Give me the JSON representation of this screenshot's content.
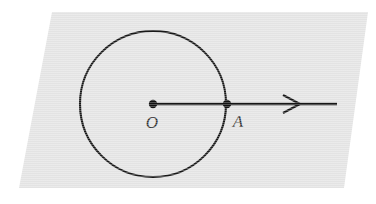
{
  "figure": {
    "background_color": "#ffffff",
    "plane": {
      "name": "plane",
      "fill_color": "#e3e3e3",
      "shape": "parallelogram",
      "points": "52,12 368,12 344,188 19,188"
    },
    "circle": {
      "label": "circle",
      "center_x": 153,
      "center_y": 104,
      "radius": 73,
      "stroke_color": "#181818",
      "stroke_width": 2.1
    },
    "ray": {
      "label": "ray",
      "x1": 153,
      "y1": 104,
      "x2": 337,
      "y2": 104,
      "stroke_color": "#161616",
      "stroke_width": 2.4
    },
    "arrowhead": {
      "label": "arrowhead",
      "style": "open-chevron",
      "tip_x": 300,
      "tip_y": 104,
      "back_x": 283,
      "top_y": 95,
      "bottom_y": 113,
      "path": "M 283,95 L 300,104 L 283,113"
    },
    "points": [
      {
        "id": "O",
        "label": "O",
        "dot_x": 153,
        "dot_y": 104,
        "dot_radius": 4.2,
        "label_x": 152,
        "label_y": 128,
        "dot_color": "#111111",
        "label_color": "#303030"
      },
      {
        "id": "A",
        "label": "A",
        "dot_x": 227,
        "dot_y": 104,
        "dot_radius": 4.2,
        "label_x": 238,
        "label_y": 127,
        "dot_color": "#111111",
        "label_color": "#303030"
      }
    ]
  }
}
